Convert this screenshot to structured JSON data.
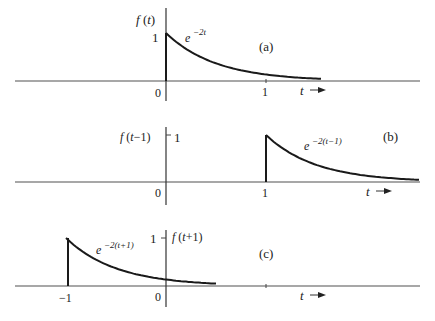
{
  "figure": {
    "panels": [
      {
        "id": "a",
        "tag": "(a)",
        "ylabel": "f (t)",
        "expr_base": "e",
        "expr_exp": "−2t",
        "tick_one": "1",
        "origin_label": "0",
        "xtick_labels": [
          {
            "t": 1,
            "label": "1"
          }
        ],
        "t_label": "t",
        "start": 0,
        "end": 1.55
      },
      {
        "id": "b",
        "tag": "(b)",
        "ylabel": "f (t−1)",
        "expr_base": "e",
        "expr_exp": "−2(t−1)",
        "tick_one": "1",
        "origin_label": "0",
        "xtick_labels": [
          {
            "t": 1,
            "label": "1"
          }
        ],
        "t_label": "t",
        "start": 1,
        "end": 2.53
      },
      {
        "id": "c",
        "tag": "(c)",
        "ylabel": "f (t+1)",
        "expr_base": "e",
        "expr_exp": "−2(t+1)",
        "tick_one": "1",
        "origin_label": "0",
        "xtick_labels": [
          {
            "t": -1,
            "label": "−1"
          }
        ],
        "t_label": "t",
        "start": -1,
        "end": 0.5
      }
    ]
  },
  "chart_data": [
    {
      "type": "line",
      "title": "(a)",
      "function": "f(t) = e^{-2t}, t >= 0",
      "ylabel": "f(t)",
      "xlabel": "t",
      "x": [
        0,
        0.25,
        0.5,
        0.75,
        1.0,
        1.25,
        1.5
      ],
      "values": [
        1.0,
        0.607,
        0.368,
        0.223,
        0.135,
        0.082,
        0.05
      ],
      "x_ticks": [
        0,
        1
      ],
      "y_ticks": [
        1
      ],
      "annotation": "e^{-2t}"
    },
    {
      "type": "line",
      "title": "(b)",
      "function": "f(t-1) = e^{-2(t-1)}, t >= 1",
      "ylabel": "f(t-1)",
      "xlabel": "t",
      "x": [
        1,
        1.25,
        1.5,
        1.75,
        2.0,
        2.25,
        2.5
      ],
      "values": [
        1.0,
        0.607,
        0.368,
        0.223,
        0.135,
        0.082,
        0.05
      ],
      "x_ticks": [
        0,
        1
      ],
      "y_ticks": [
        1
      ],
      "annotation": "e^{-2(t-1)}"
    },
    {
      "type": "line",
      "title": "(c)",
      "function": "f(t+1) = e^{-2(t+1)}, t >= -1",
      "ylabel": "f(t+1)",
      "xlabel": "t",
      "x": [
        -1,
        -0.75,
        -0.5,
        -0.25,
        0,
        0.25,
        0.5
      ],
      "values": [
        1.0,
        0.607,
        0.368,
        0.223,
        0.135,
        0.082,
        0.05
      ],
      "x_ticks": [
        -1,
        0
      ],
      "y_ticks": [
        1
      ],
      "annotation": "e^{-2(t+1)}"
    }
  ]
}
